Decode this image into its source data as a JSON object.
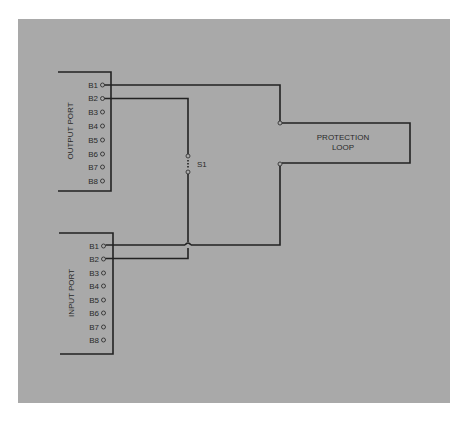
{
  "diagram": {
    "background_color": "#a9a9a9",
    "line_color": "#222222",
    "output_port": {
      "label": "OUTPUT PORT",
      "pins": [
        "B1",
        "B2",
        "B3",
        "B4",
        "B5",
        "B6",
        "B7",
        "B8"
      ]
    },
    "input_port": {
      "label": "INPUT PORT",
      "pins": [
        "B1",
        "B2",
        "B3",
        "B4",
        "B5",
        "B6",
        "B7",
        "B8"
      ]
    },
    "switch": {
      "label": "S1"
    },
    "protection_loop": {
      "line1": "PROTECTION",
      "line2": "LOOP"
    },
    "connections": [
      {
        "from": "OUTPUT PORT B1",
        "to": "PROTECTION LOOP (top)"
      },
      {
        "from": "PROTECTION LOOP (bottom)",
        "to": "INPUT PORT B1"
      },
      {
        "from": "OUTPUT PORT B2",
        "via": "S1",
        "to": "INPUT PORT B2"
      }
    ]
  }
}
